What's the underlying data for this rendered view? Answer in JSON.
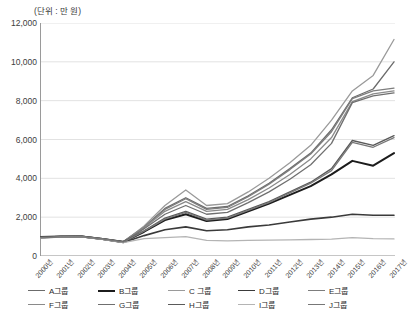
{
  "unit_label": "(단위 : 만 원)",
  "axis": {
    "y_ticks": [
      "12,000",
      "10,000",
      "8,000",
      "6,000",
      "4,000",
      "2,000",
      "0"
    ],
    "x_ticks": [
      "2000년",
      "2001년",
      "2002년",
      "2003년",
      "2004년",
      "2005년",
      "2006년",
      "2007년",
      "2008년",
      "2009년",
      "2010년",
      "2011년",
      "2012년",
      "2013년",
      "2014년",
      "2015년",
      "2016년",
      "2017년"
    ]
  },
  "legend": {
    "items": [
      {
        "label": "A그룹",
        "color": "#6b6b6b",
        "width": 1.3
      },
      {
        "label": "B그룹",
        "color": "#1c1c1c",
        "width": 2.0
      },
      {
        "label": "C 그룹",
        "color": "#9a9a9a",
        "width": 1.3
      },
      {
        "label": "D그룹",
        "color": "#3a3a3a",
        "width": 1.6
      },
      {
        "label": "E그룹",
        "color": "#7d7d7d",
        "width": 1.3
      },
      {
        "label": "F그룹",
        "color": "#8a8a8a",
        "width": 1.3
      },
      {
        "label": "G그룹",
        "color": "#6f6f6f",
        "width": 1.3
      },
      {
        "label": "H그룹",
        "color": "#5a5a5a",
        "width": 1.4
      },
      {
        "label": "I그룹",
        "color": "#b4b4b4",
        "width": 1.3
      },
      {
        "label": "J그룹",
        "color": "#777777",
        "width": 1.3
      }
    ]
  },
  "chart_data": {
    "type": "line",
    "title": "",
    "subtitle": "",
    "xlabel": "",
    "ylabel": "(단위 : 만 원)",
    "ylim": [
      0,
      12000
    ],
    "ytick_step": 2000,
    "grid": true,
    "legend_position": "bottom",
    "x": [
      "2000년",
      "2001년",
      "2002년",
      "2003년",
      "2004년",
      "2005년",
      "2006년",
      "2007년",
      "2008년",
      "2009년",
      "2010년",
      "2011년",
      "2012년",
      "2013년",
      "2014년",
      "2015년",
      "2016년",
      "2017년"
    ],
    "series": [
      {
        "name": "A그룹",
        "color": "#6b6b6b",
        "width": 1.3,
        "values": [
          950,
          1000,
          1020,
          900,
          750,
          1500,
          2450,
          3000,
          2450,
          2550,
          3100,
          3750,
          4500,
          5300,
          6500,
          8150,
          8600,
          10000
        ]
      },
      {
        "name": "B그룹",
        "color": "#1c1c1c",
        "width": 2.0,
        "values": [
          980,
          1010,
          1000,
          880,
          720,
          1250,
          1850,
          2150,
          1800,
          1900,
          2300,
          2700,
          3150,
          3600,
          4200,
          4900,
          4650,
          5300
        ]
      },
      {
        "name": "C 그룹",
        "color": "#9a9a9a",
        "width": 1.3,
        "values": [
          930,
          980,
          1000,
          870,
          700,
          1550,
          2600,
          3400,
          2600,
          2700,
          3300,
          4000,
          4800,
          5700,
          7000,
          8500,
          9300,
          11150
        ]
      },
      {
        "name": "D그룹",
        "color": "#3a3a3a",
        "width": 1.6,
        "values": [
          960,
          1000,
          990,
          860,
          700,
          1050,
          1350,
          1500,
          1300,
          1350,
          1500,
          1600,
          1750,
          1900,
          2000,
          2150,
          2100,
          2100
        ]
      },
      {
        "name": "E그룹",
        "color": "#7d7d7d",
        "width": 1.3,
        "values": [
          940,
          990,
          1010,
          890,
          730,
          1480,
          2400,
          2950,
          2400,
          2500,
          3050,
          3700,
          4450,
          5250,
          6400,
          8100,
          8500,
          8650
        ]
      },
      {
        "name": "F그룹",
        "color": "#8a8a8a",
        "width": 1.3,
        "values": [
          955,
          995,
          1005,
          875,
          715,
          1450,
          2300,
          2800,
          2300,
          2400,
          2900,
          3500,
          4200,
          5000,
          6100,
          7950,
          8350,
          8500
        ]
      },
      {
        "name": "G그룹",
        "color": "#6f6f6f",
        "width": 1.3,
        "values": [
          945,
          985,
          995,
          865,
          705,
          1400,
          2150,
          2600,
          2150,
          2250,
          2750,
          3300,
          3950,
          4700,
          5800,
          7900,
          8250,
          8400
        ]
      },
      {
        "name": "H그룹",
        "color": "#5a5a5a",
        "width": 1.4,
        "values": [
          970,
          1005,
          1015,
          885,
          725,
          1300,
          1950,
          2300,
          1900,
          2000,
          2400,
          2800,
          3300,
          3800,
          4500,
          5950,
          5700,
          6200
        ]
      },
      {
        "name": "I그룹",
        "color": "#b4b4b4",
        "width": 1.3,
        "values": [
          920,
          970,
          985,
          855,
          690,
          900,
          950,
          1000,
          800,
          780,
          800,
          820,
          830,
          850,
          870,
          950,
          900,
          880
        ]
      },
      {
        "name": "J그룹",
        "color": "#777777",
        "width": 1.3,
        "values": [
          935,
          975,
          990,
          870,
          710,
          1280,
          1900,
          2250,
          1850,
          1950,
          2350,
          2750,
          3250,
          3750,
          4400,
          5850,
          5600,
          6100
        ]
      }
    ]
  }
}
